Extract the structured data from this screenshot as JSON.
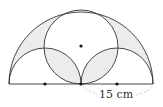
{
  "diagram": {
    "type": "geometry",
    "measurement_label": "15 cm",
    "colors": {
      "stroke": "#333333",
      "shade": "#e6e6e6",
      "dashed": "#bbbbbb"
    },
    "points": [
      {
        "name": "left-small-center",
        "x": 45,
        "y": 84
      },
      {
        "name": "big-center",
        "x": 81,
        "y": 84
      },
      {
        "name": "right-small-center",
        "x": 117,
        "y": 84
      },
      {
        "name": "circle-center",
        "x": 81,
        "y": 46
      }
    ]
  }
}
